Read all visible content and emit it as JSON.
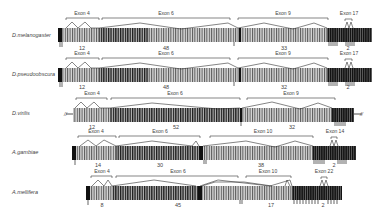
{
  "diagram": {
    "type": "exon-structure comparison",
    "rows": [
      {
        "species": "D.melanogaster",
        "exons": [
          {
            "label": "Exon 4",
            "count": "12"
          },
          {
            "label": "Exon 6",
            "count": "48"
          },
          {
            "label": "Exon 9",
            "count": "33"
          },
          {
            "label": "Exon 17",
            "count": "2"
          }
        ]
      },
      {
        "species": "D.pseudoobscura",
        "exons": [
          {
            "label": "Exon 4",
            "count": "12"
          },
          {
            "label": "Exon 6",
            "count": "48"
          },
          {
            "label": "Exon 9",
            "count": "32"
          },
          {
            "label": "Exon 17",
            "count": "2"
          }
        ]
      },
      {
        "species": "D.virilis",
        "exons": [
          {
            "label": "Exon 4",
            "count": "12"
          },
          {
            "label": "Exon 6",
            "count": "52"
          },
          {
            "label": "Exon 9",
            "count": "32"
          }
        ],
        "truncated_marker": "//"
      },
      {
        "species": "A.gambiae",
        "exons": [
          {
            "label": "Exon 4",
            "count": "14"
          },
          {
            "label": "Exon 6",
            "count": "30"
          },
          {
            "label": "Exon 10",
            "count": "38"
          },
          {
            "label": "Exon 14",
            "count": "2"
          }
        ]
      },
      {
        "species": "A.mellifera",
        "exons": [
          {
            "label": "Exon 4",
            "count": "8"
          },
          {
            "label": "Exon 6",
            "count": "45"
          },
          {
            "label": "Exon 10",
            "count": "17"
          },
          {
            "label": "Exon 22",
            "count": "2"
          }
        ]
      }
    ]
  }
}
